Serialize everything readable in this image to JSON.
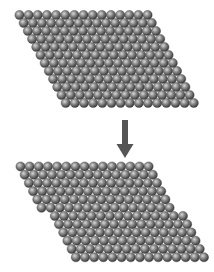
{
  "figure": {
    "colors": {
      "background": "#ffffff",
      "atom_dark": "#3a3a3a",
      "atom_mid": "#7a7a7a",
      "atom_light": "#d8d8d8",
      "arrow": "#555555"
    },
    "atom": {
      "radius": 4.6,
      "pitch": 9.15
    },
    "lattices": [
      {
        "name": "lattice-before-slip",
        "origin_x": 19.5,
        "origin_y": 15,
        "row_spacing": 8.0,
        "row_shift": 4.2,
        "rows": 12,
        "cols": 15,
        "slip_row": null,
        "slip_offset": 0
      },
      {
        "name": "lattice-after-slip",
        "origin_x": 20.5,
        "origin_y": 166.5,
        "row_spacing": 8.25,
        "row_shift": 4.2,
        "rows": 12,
        "cols": 15,
        "slip_row": 6,
        "slip_offset": 1
      }
    ],
    "arrow": {
      "x": 125,
      "y_top": 120,
      "y_bottom": 158,
      "shaft_width": 6,
      "head_width": 17,
      "head_height": 14
    }
  }
}
